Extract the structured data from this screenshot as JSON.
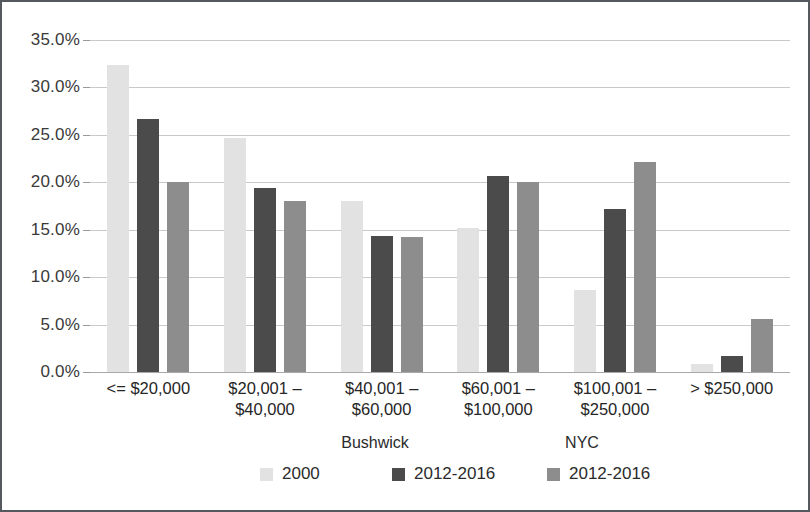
{
  "chart_data": {
    "type": "bar",
    "title": "",
    "subtitle": "",
    "xlabel": "",
    "ylabel": "",
    "ylim": [
      0,
      35
    ],
    "ytick_step": 5,
    "grid": true,
    "legend_position": "bottom",
    "categories": [
      "<= $20,000",
      "$20,001 –\n$40,000",
      "$40,001 –\n$60,000",
      "$60,001 –\n$100,000",
      "$100,001 –\n$250,000",
      "> $250,000"
    ],
    "ytick_labels": [
      "0.0%",
      "5.0%",
      "10.0%",
      "15.0%",
      "20.0%",
      "25.0%",
      "30.0%",
      "35.0%"
    ],
    "ytick_values": [
      0,
      5,
      10,
      15,
      20,
      25,
      30,
      35
    ],
    "series": [
      {
        "name": "2000",
        "group": "Bushwick",
        "color": "#e2e2e2",
        "values": [
          32.4,
          24.7,
          18.0,
          15.2,
          8.6,
          0.8
        ]
      },
      {
        "name": "2012-2016",
        "group": "Bushwick",
        "color": "#4b4b4b",
        "values": [
          26.7,
          19.4,
          14.3,
          20.7,
          17.2,
          1.7
        ]
      },
      {
        "name": "2012-2016",
        "group": "NYC",
        "color": "#8d8d8d",
        "values": [
          20.0,
          18.0,
          14.2,
          20.0,
          22.1,
          5.6
        ]
      }
    ]
  },
  "legend": {
    "groups": [
      {
        "title": "Bushwick",
        "entries": [
          0,
          1
        ]
      },
      {
        "title": "NYC",
        "entries": [
          2
        ]
      }
    ]
  },
  "colors": {
    "series_2000": "#e2e2e2",
    "series_bushwick_2012_2016": "#4b4b4b",
    "series_nyc_2012_2016": "#8d8d8d",
    "gridline": "#c9c9c9",
    "border": "#55585c",
    "text": "#262626"
  }
}
